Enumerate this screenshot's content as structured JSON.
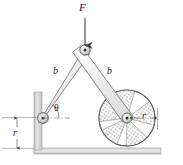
{
  "figure": {
    "background_color": "#ffffff",
    "line_color": "#3c3c3c",
    "fill_gray": "#e8e8e8",
    "hatch_gray": "#9a9a9a",
    "ground_gray": "#cfcfcf"
  },
  "labels": {
    "force": "F",
    "link_left": "b",
    "link_right": "b",
    "angle": "θ",
    "radius_wheel": "r",
    "radius_height": "r"
  },
  "diagram_data": {
    "type": "mechanism-schematic",
    "units": "px",
    "canvas": {
      "width": 183,
      "height": 165
    },
    "points": {
      "apex_pin": {
        "x": 85,
        "y": 50
      },
      "wall_pin": {
        "x": 43,
        "y": 118
      },
      "wheel_center": {
        "x": 127,
        "y": 118
      }
    },
    "members": [
      {
        "name": "link-left",
        "from": "wall_pin",
        "to": "apex_pin",
        "label": "b"
      },
      {
        "name": "link-right",
        "from": "apex_pin",
        "to": "wheel_center",
        "label": "b"
      }
    ],
    "wheel": {
      "center_x": 127,
      "center_y": 118,
      "radius": 28,
      "spoke_sectors": 7
    },
    "force_arrow": {
      "x": 85,
      "y_start": 18,
      "y_end": 48,
      "direction": "down",
      "label": "F"
    },
    "angle_marker": {
      "at": "wall_pin",
      "from_axis": "horizontal-right",
      "label": "θ",
      "degrees": 58
    },
    "dimensions": [
      {
        "name": "wheel-radius",
        "from": "wheel_center",
        "to_x": 155,
        "to_y": 118,
        "label": "r",
        "orientation": "horizontal"
      },
      {
        "name": "pivot-height",
        "x": 17,
        "from_y": 118,
        "to_y": 148,
        "label": "r",
        "orientation": "vertical"
      }
    ],
    "supports": {
      "wall": {
        "x": 34,
        "y": 92,
        "width": 8,
        "height": 56,
        "type": "vertical-fixed-wall"
      },
      "ground": {
        "x": 34,
        "y": 148,
        "width": 127,
        "height": 6,
        "type": "horizontal-ground"
      }
    }
  }
}
